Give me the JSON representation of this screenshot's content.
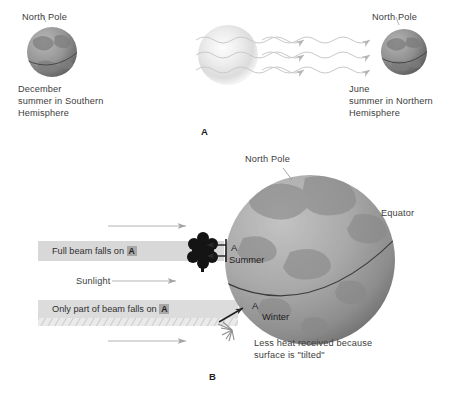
{
  "figure": {
    "panel_a": {
      "letter": "A",
      "left_globe": {
        "pole_label": "North Pole",
        "caption_line1": "December",
        "caption_line2": "summer in Southern",
        "caption_line3": "Hemisphere"
      },
      "right_globe": {
        "pole_label": "North Pole",
        "caption_line1": "June",
        "caption_line2": "summer in Northern",
        "caption_line3": "Hemisphere"
      },
      "sun": {
        "name": "sun",
        "ray_count_per_side": 3
      }
    },
    "panel_b": {
      "letter": "B",
      "globe": {
        "pole_label": "North Pole",
        "equator_label": "Equator"
      },
      "beams": [
        {
          "id": "full-beam",
          "label_prefix": "Full beam falls on",
          "label_target": "A",
          "style": "solid"
        },
        {
          "id": "partial-beam",
          "label_prefix": "Only part of beam falls on",
          "label_target": "A",
          "style": "hatched"
        }
      ],
      "sunlight_label": "Sunlight",
      "surface_labels": [
        {
          "marker": "A",
          "season": "Summer"
        },
        {
          "marker": "A",
          "season": "Winter"
        }
      ],
      "note_line1": "Less heat received because",
      "note_line2": "surface is \"tilted\""
    }
  },
  "colors": {
    "background": "#ffffff",
    "text": "#3c3c3c",
    "globe_land": "#9a9a9a",
    "globe_ocean": "#b4b4b4",
    "beam_band": "#d6d6d6",
    "arrow": "#b0b0b0",
    "tree_summer": "#1a1a1a",
    "tree_winter": "#8e8e8e"
  }
}
